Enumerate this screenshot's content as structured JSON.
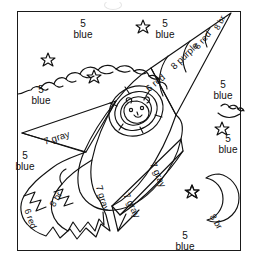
{
  "page": {
    "width": 260,
    "height": 269,
    "background": "#ffffff",
    "ink": "#111111"
  },
  "frame": {
    "name": "picture-border",
    "stroke": "#1a1a1a"
  },
  "legend_key": {
    "5": "blue",
    "6": "red",
    "7": "gray",
    "8": "purple",
    "8b": "br"
  },
  "labels": {
    "sky_top_left": {
      "number": "5",
      "color": "blue"
    },
    "sky_top_center": {
      "number": "5",
      "color": "blue"
    },
    "sky_upper_right": {
      "number": "5",
      "color": "blue"
    },
    "cloud_left": {
      "number": "5",
      "color": "blue"
    },
    "sky_right": {
      "number": "5",
      "color": "blue"
    },
    "sky_mid_right": {
      "number": "5",
      "color": "blue"
    },
    "sky_left": {
      "number": "5",
      "color": "blue"
    },
    "sky_bottom": {
      "number": "5",
      "color": "blue"
    },
    "nose_tip": "8 br",
    "nose_band_red_upper": "6 red",
    "nose_band_purple": "8 purple",
    "nose_band_red_lower": "6 red",
    "wing_left": "7 gray",
    "body_left": "7 gray",
    "body_right": "7 gray",
    "fin_lower_right": "7 gray",
    "flame_outer": "6 red",
    "flame_inner": "8 br",
    "moon": "8 br"
  },
  "shapes": {
    "stars": [
      {
        "name": "star-top-right",
        "x": 143,
        "y": 25
      },
      {
        "name": "star-upper-left",
        "x": 48,
        "y": 58
      },
      {
        "name": "star-cloud",
        "x": 94,
        "y": 75
      },
      {
        "name": "star-right",
        "x": 222,
        "y": 127
      },
      {
        "name": "star-near-moon",
        "x": 192,
        "y": 190
      }
    ],
    "moon": {
      "name": "crescent-moon",
      "label": "8 br"
    },
    "porthole": {
      "name": "rocket-porthole-window"
    },
    "clouds": 2
  }
}
